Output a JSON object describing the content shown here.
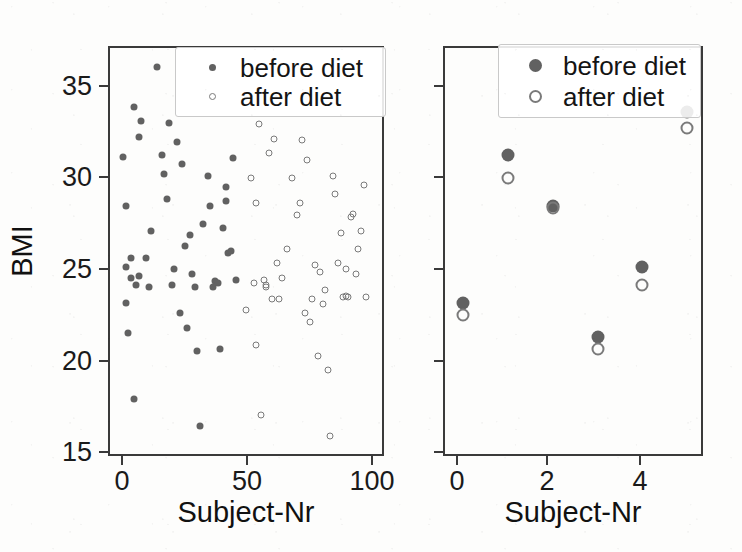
{
  "figure": {
    "background_color": "#fdfdfc",
    "marker_filled_color": "#616161",
    "marker_open_color": "#7a7a7a",
    "frame_color": "#3a3a3a"
  },
  "panels": [
    {
      "id": "left",
      "legend": {
        "entries": [
          {
            "label": "before diet",
            "marker": "filled-circle"
          },
          {
            "label": "after diet",
            "marker": "open-circle"
          }
        ]
      }
    },
    {
      "id": "right",
      "legend": {
        "entries": [
          {
            "label": "before diet",
            "marker": "filled-circle"
          },
          {
            "label": "after diet",
            "marker": "open-circle"
          }
        ]
      }
    }
  ],
  "chart_data": [
    {
      "type": "scatter",
      "panel": "left",
      "title": "",
      "xlabel": "Subject-Nr",
      "ylabel": "BMI",
      "xlim": [
        -4,
        104
      ],
      "ylim": [
        14.4,
        37.4
      ],
      "xticks": [
        0,
        50,
        100
      ],
      "xticklabels": [
        "0",
        "50",
        "100"
      ],
      "yticks": [
        15,
        20,
        25,
        30,
        35
      ],
      "yticklabels": [
        "15",
        "20",
        "25",
        "30",
        "35"
      ],
      "grid": false,
      "legend_position": "upper center",
      "series": [
        {
          "name": "before diet",
          "marker": "filled-circle",
          "color": "#616161",
          "points": [
            [
              2,
              31.2
            ],
            [
              3,
              28.4
            ],
            [
              3,
              25.0
            ],
            [
              3,
              23.0
            ],
            [
              4,
              21.3
            ],
            [
              5,
              25.5
            ],
            [
              5,
              24.4
            ],
            [
              6,
              34.0
            ],
            [
              6,
              17.6
            ],
            [
              7,
              24.0
            ],
            [
              8,
              32.3
            ],
            [
              8,
              24.5
            ],
            [
              9,
              33.2
            ],
            [
              11,
              25.5
            ],
            [
              12,
              23.9
            ],
            [
              13,
              27.0
            ],
            [
              15,
              36.2
            ],
            [
              17,
              31.3
            ],
            [
              18,
              30.2
            ],
            [
              19,
              28.8
            ],
            [
              20,
              33.1
            ],
            [
              21,
              24.0
            ],
            [
              22,
              24.9
            ],
            [
              23,
              32.0
            ],
            [
              24,
              22.4
            ],
            [
              25,
              30.8
            ],
            [
              26,
              26.2
            ],
            [
              27,
              21.6
            ],
            [
              28,
              26.8
            ],
            [
              29,
              24.6
            ],
            [
              30,
              23.9
            ],
            [
              31,
              20.3
            ],
            [
              32,
              16.1
            ],
            [
              33,
              27.4
            ],
            [
              35,
              30.1
            ],
            [
              36,
              28.4
            ],
            [
              37,
              23.9
            ],
            [
              38,
              24.2
            ],
            [
              39,
              24.1
            ],
            [
              40,
              20.4
            ],
            [
              41,
              27.2
            ],
            [
              42,
              29.5
            ],
            [
              42,
              28.7
            ],
            [
              43,
              25.8
            ],
            [
              44,
              25.9
            ],
            [
              45,
              31.1
            ],
            [
              46,
              24.3
            ]
          ]
        },
        {
          "name": "after diet",
          "marker": "open-circle",
          "color": "#7a7a7a",
          "points": [
            [
              50,
              22.6
            ],
            [
              52,
              30.0
            ],
            [
              53,
              24.1
            ],
            [
              54,
              28.6
            ],
            [
              54,
              20.6
            ],
            [
              55,
              33.0
            ],
            [
              56,
              16.7
            ],
            [
              57,
              24.3
            ],
            [
              58,
              23.9
            ],
            [
              58,
              24.0
            ],
            [
              59,
              31.4
            ],
            [
              60,
              23.2
            ],
            [
              61,
              32.2
            ],
            [
              62,
              25.2
            ],
            [
              63,
              23.2
            ],
            [
              64,
              24.4
            ],
            [
              66,
              26.0
            ],
            [
              68,
              30.0
            ],
            [
              70,
              27.9
            ],
            [
              71,
              28.6
            ],
            [
              72,
              32.1
            ],
            [
              73,
              22.4
            ],
            [
              74,
              31.0
            ],
            [
              75,
              21.9
            ],
            [
              76,
              23.2
            ],
            [
              77,
              25.1
            ],
            [
              78,
              20.0
            ],
            [
              79,
              24.7
            ],
            [
              80,
              22.9
            ],
            [
              81,
              23.7
            ],
            [
              82,
              19.2
            ],
            [
              83,
              15.5
            ],
            [
              84,
              30.1
            ],
            [
              85,
              29.1
            ],
            [
              86,
              25.2
            ],
            [
              87,
              26.9
            ],
            [
              88,
              23.3
            ],
            [
              89,
              24.9
            ],
            [
              89,
              23.4
            ],
            [
              90,
              23.3
            ],
            [
              91,
              27.8
            ],
            [
              92,
              28.0
            ],
            [
              93,
              24.6
            ],
            [
              94,
              26.0
            ],
            [
              95,
              27.0
            ],
            [
              96,
              29.6
            ],
            [
              97,
              23.3
            ]
          ]
        }
      ]
    },
    {
      "type": "scatter",
      "panel": "right",
      "title": "",
      "xlabel": "Subject-Nr",
      "ylabel": "",
      "xlim": [
        -0.45,
        5.35
      ],
      "ylim": [
        14.4,
        37.4
      ],
      "xticks": [
        0,
        2,
        4
      ],
      "xticklabels": [
        "0",
        "2",
        "4"
      ],
      "yticks": [
        15,
        20,
        25,
        30,
        35
      ],
      "yticklabels": [],
      "grid": false,
      "legend_position": "upper center",
      "series": [
        {
          "name": "before diet",
          "marker": "filled-circle",
          "color": "#616161",
          "points": [
            [
              0,
              23.0
            ],
            [
              1,
              31.3
            ],
            [
              2,
              28.4
            ],
            [
              3,
              21.1
            ],
            [
              4,
              25.0
            ],
            [
              5,
              33.7
            ]
          ]
        },
        {
          "name": "after diet",
          "marker": "open-circle",
          "color": "#7a7a7a",
          "points": [
            [
              0,
              22.3
            ],
            [
              1,
              30.0
            ],
            [
              2,
              28.3
            ],
            [
              3,
              20.4
            ],
            [
              4,
              24.0
            ],
            [
              5,
              32.8
            ]
          ]
        }
      ]
    }
  ]
}
